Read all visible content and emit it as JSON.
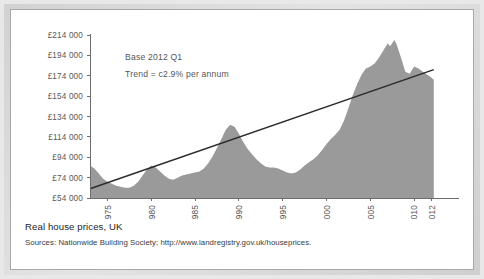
{
  "caption": {
    "title": "Real house prices, UK",
    "sources": "Sources: Nationwide Building Society; http://www.landregistry.gov.uk/houseprices."
  },
  "colors": {
    "area_fill": "#9a9a9a",
    "trend_line": "#2b2b2b",
    "axis": "#6d6d6d",
    "tick_text": "#58585a",
    "card_background": "#ffffff",
    "page_background": "#e0e0e0"
  },
  "chart_data": {
    "type": "area",
    "title": "Real house prices, UK",
    "xlabel": "",
    "ylabel": "",
    "grid": false,
    "legend": "none",
    "annotations": [
      "Base 2012 Q1",
      "Trend = c2.9% per annum"
    ],
    "ylim": [
      54000,
      214000
    ],
    "ytick_labels": [
      "£214 000",
      "£194 000",
      "£174 000",
      "£154 000",
      "£134 000",
      "£114 000",
      "£94 000",
      "£74 000",
      "£54 000"
    ],
    "ytick_values": [
      214000,
      194000,
      174000,
      154000,
      134000,
      114000,
      94000,
      74000,
      54000
    ],
    "xlim": [
      1973,
      2012.5
    ],
    "xtick_labels": [
      "1975",
      "1980",
      "1985",
      "1990",
      "1995",
      "2000",
      "2005",
      "2010",
      "2012"
    ],
    "xtick_values": [
      1975,
      1980,
      1985,
      1990,
      1995,
      2000,
      2005,
      2010,
      2012
    ],
    "series": [
      {
        "name": "Real house prices",
        "kind": "area",
        "x": [
          1973.0,
          1973.5,
          1974.0,
          1974.5,
          1975.0,
          1975.5,
          1976.0,
          1976.5,
          1977.0,
          1977.5,
          1978.0,
          1978.5,
          1979.0,
          1979.5,
          1980.0,
          1980.5,
          1981.0,
          1981.5,
          1982.0,
          1982.5,
          1983.0,
          1983.5,
          1984.0,
          1984.5,
          1985.0,
          1985.5,
          1986.0,
          1986.5,
          1987.0,
          1987.5,
          1988.0,
          1988.5,
          1989.0,
          1989.5,
          1990.0,
          1990.5,
          1991.0,
          1991.5,
          1992.0,
          1992.5,
          1993.0,
          1993.5,
          1994.0,
          1994.5,
          1995.0,
          1995.5,
          1996.0,
          1996.5,
          1997.0,
          1997.5,
          1998.0,
          1998.5,
          1999.0,
          1999.5,
          2000.0,
          2000.5,
          2001.0,
          2001.5,
          2002.0,
          2002.5,
          2003.0,
          2003.5,
          2004.0,
          2004.5,
          2005.0,
          2005.5,
          2006.0,
          2006.5,
          2007.0,
          2007.25,
          2007.75,
          2008.0,
          2008.5,
          2009.0,
          2009.5,
          2010.0,
          2010.5,
          2011.0,
          2011.5,
          2012.0,
          2012.25
        ],
        "y": [
          86000,
          83000,
          78000,
          73000,
          70000,
          68000,
          66000,
          65000,
          64000,
          64000,
          66000,
          70000,
          76000,
          82000,
          86000,
          84000,
          80000,
          76000,
          73000,
          72000,
          74000,
          76000,
          77000,
          78000,
          79000,
          80000,
          83000,
          88000,
          95000,
          103000,
          112000,
          121000,
          126000,
          124000,
          117000,
          109000,
          102000,
          97000,
          92000,
          88000,
          85000,
          84000,
          84000,
          83000,
          81000,
          79000,
          78000,
          79000,
          82000,
          86000,
          89000,
          92000,
          96000,
          101000,
          107000,
          112000,
          116000,
          121000,
          130000,
          142000,
          155000,
          166000,
          175000,
          181000,
          183000,
          186000,
          192000,
          199000,
          206000,
          203000,
          209000,
          205000,
          192000,
          178000,
          176000,
          183000,
          181000,
          178000,
          175000,
          172000,
          170000
        ]
      },
      {
        "name": "Trend = c2.9% per annum",
        "kind": "line",
        "x": [
          1973,
          2012.25
        ],
        "y": [
          63000,
          180000
        ]
      }
    ]
  }
}
